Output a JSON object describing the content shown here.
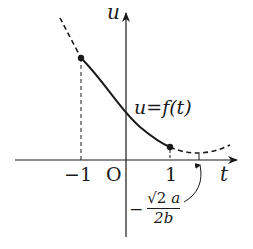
{
  "diagram": {
    "axes": {
      "horizontal_label": "t",
      "vertical_label": "u",
      "origin_label": "O"
    },
    "tick_labels": {
      "neg_one": "−1",
      "one": "1"
    },
    "curve_label": "u=f(t)",
    "vertex_label": {
      "sign": "−",
      "numerator_root": "√2",
      "numerator_var": "a",
      "denominator": "2b"
    },
    "colors": {
      "ink": "#1a1a1a",
      "background": "#ffffff"
    }
  }
}
